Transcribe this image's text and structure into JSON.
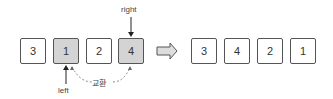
{
  "before": {
    "cells": [
      {
        "value": "3",
        "highlighted": false
      },
      {
        "value": "1",
        "highlighted": true
      },
      {
        "value": "2",
        "highlighted": false
      },
      {
        "value": "4",
        "highlighted": true
      }
    ],
    "pointers": {
      "left": "left",
      "right": "right"
    },
    "swap_label": "교환"
  },
  "after": {
    "cells": [
      {
        "value": "3"
      },
      {
        "value": "4"
      },
      {
        "value": "2"
      },
      {
        "value": "1"
      }
    ]
  },
  "colors": {
    "highlight": "#d4d4d4",
    "border": "#555555"
  }
}
